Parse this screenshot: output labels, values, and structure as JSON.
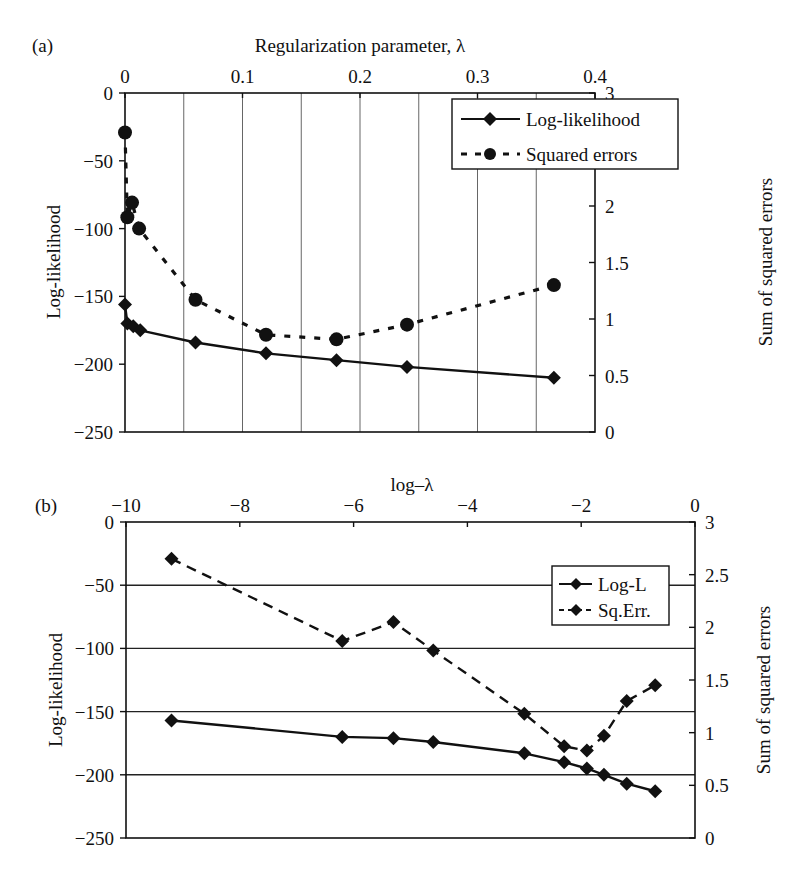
{
  "chart_data": [
    {
      "panel": "(a)",
      "type": "line",
      "title": "",
      "xlabel": "Regularization parameter, λ",
      "xlabel_position": "top",
      "ylabel": "Log-likelihood",
      "ylabel_right": "Sum of squared errors",
      "xlim": [
        0,
        0.4
      ],
      "ylim": [
        -250,
        0
      ],
      "ylim_right": [
        0,
        3
      ],
      "xticks": [
        "0",
        "0.1",
        "0.2",
        "0.3",
        "0.4"
      ],
      "xtick_values": [
        0,
        0.1,
        0.2,
        0.3,
        0.4
      ],
      "yticks": [
        "0",
        "−50",
        "−100",
        "−150",
        "−200",
        "−250"
      ],
      "ytick_values": [
        0,
        -50,
        -100,
        -150,
        -200,
        -250
      ],
      "yticks_right": [
        "3",
        "2.5",
        "2",
        "1.5",
        "1",
        "0.5",
        "0"
      ],
      "ytick_right_values": [
        3,
        2.5,
        2,
        1.5,
        1,
        0.5,
        0
      ],
      "grid": "vertical lines every 0.05",
      "grid_x_values": [
        0.05,
        0.1,
        0.15,
        0.2,
        0.25,
        0.3,
        0.35
      ],
      "legend_position": "upper right",
      "series": [
        {
          "name": "Log-likelihood",
          "axis": "left",
          "style": "solid",
          "marker": "diamond",
          "x": [
            0,
            0.002,
            0.007,
            0.013,
            0.06,
            0.12,
            0.18,
            0.24,
            0.365
          ],
          "values": [
            -156,
            -170,
            -172,
            -175,
            -184,
            -192,
            -197,
            -202,
            -210
          ]
        },
        {
          "name": "Squared errors",
          "axis": "right",
          "style": "dotted",
          "marker": "circle",
          "x": [
            0,
            0.002,
            0.006,
            0.012,
            0.06,
            0.12,
            0.18,
            0.24,
            0.365
          ],
          "values": [
            2.65,
            1.9,
            2.03,
            1.8,
            1.17,
            0.86,
            0.82,
            0.95,
            1.3
          ]
        }
      ]
    },
    {
      "panel": "(b)",
      "type": "line",
      "title": "",
      "xlabel": "log–λ",
      "xlabel_position": "top",
      "ylabel": "Log-likelihood",
      "ylabel_right": "Sum of squared errors",
      "xlim": [
        -10,
        0
      ],
      "ylim": [
        -250,
        0
      ],
      "ylim_right": [
        0,
        3
      ],
      "xticks": [
        "−10",
        "−8",
        "−6",
        "−4",
        "−2",
        "0"
      ],
      "xtick_values": [
        -10,
        -8,
        -6,
        -4,
        -2,
        0
      ],
      "yticks": [
        "0",
        "−50",
        "−100",
        "−150",
        "−200",
        "−250"
      ],
      "ytick_values": [
        0,
        -50,
        -100,
        -150,
        -200,
        -250
      ],
      "yticks_right": [
        "3",
        "2.5",
        "2",
        "1.5",
        "1",
        "0.5",
        "0"
      ],
      "ytick_right_values": [
        3,
        2.5,
        2,
        1.5,
        1,
        0.5,
        0
      ],
      "grid": "horizontal lines every 50",
      "grid_y_values": [
        -50,
        -100,
        -150,
        -200
      ],
      "legend_position": "upper right",
      "series": [
        {
          "name": "Log-L",
          "axis": "left",
          "style": "solid",
          "marker": "diamond",
          "x": [
            -9.2,
            -6.2,
            -5.3,
            -4.6,
            -3.0,
            -2.3,
            -1.9,
            -1.6,
            -1.2,
            -0.7
          ],
          "values": [
            -157,
            -170,
            -171,
            -174,
            -183,
            -190,
            -195,
            -200,
            -207,
            -213
          ]
        },
        {
          "name": "Sq.Err.",
          "axis": "right",
          "style": "dashed",
          "marker": "diamond",
          "x": [
            -9.2,
            -6.2,
            -5.3,
            -4.6,
            -3.0,
            -2.3,
            -1.9,
            -1.6,
            -1.2,
            -0.7
          ],
          "values": [
            2.65,
            1.87,
            2.05,
            1.78,
            1.18,
            0.87,
            0.83,
            0.97,
            1.3,
            1.45
          ]
        }
      ]
    }
  ],
  "panels": {
    "a": {
      "label": "(a)",
      "xlabel": "Regularization parameter, λ",
      "ylabel": "Log-likelihood",
      "ylabel_right": "Sum of squared errors",
      "legend": [
        "Log-likelihood",
        "Squared errors"
      ]
    },
    "b": {
      "label": "(b)",
      "xlabel": "log–λ",
      "ylabel": "Log-likelihood",
      "ylabel_right": "Sum of squared errors",
      "legend": [
        "Log-L",
        "Sq.Err."
      ]
    }
  }
}
